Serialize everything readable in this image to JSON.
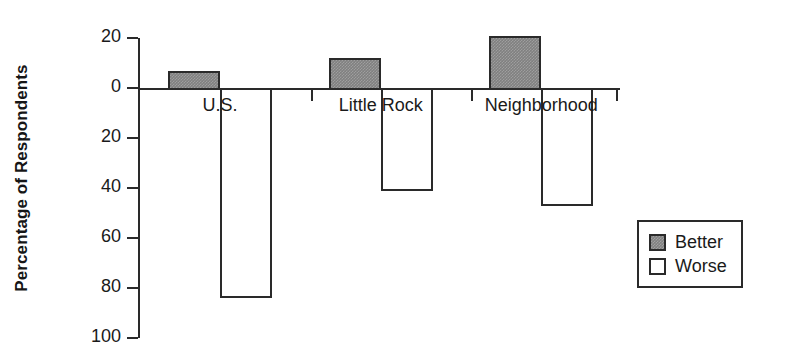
{
  "chart_data": {
    "type": "bar",
    "title": "",
    "subtitle": "",
    "xlabel": "",
    "ylabel": "Percentage of Respondents",
    "categories": [
      "U.S.",
      "Little Rock",
      "Neighborhood"
    ],
    "series": [
      {
        "name": "Better",
        "values": [
          7,
          12,
          21
        ],
        "color": "#808080",
        "fill": "gray-dither"
      },
      {
        "name": "Worse",
        "values": [
          -84,
          -41,
          -47
        ],
        "color": "#ffffff",
        "fill": "white"
      }
    ],
    "y_axis": {
      "tick_labels": [
        "20",
        "0",
        "20",
        "40",
        "60",
        "80",
        "100"
      ],
      "tick_values": [
        20,
        0,
        -20,
        -40,
        -60,
        -80,
        -100
      ],
      "ylim": [
        -100,
        20
      ],
      "note": "Labels show absolute magnitudes; values below the zero line represent 'Worse' percentages."
    },
    "grid": false,
    "legend": {
      "position": "right",
      "entries": [
        {
          "label": "Better",
          "swatch": "gray-filled"
        },
        {
          "label": "Worse",
          "swatch": "white-outline"
        }
      ]
    },
    "annotations": []
  }
}
